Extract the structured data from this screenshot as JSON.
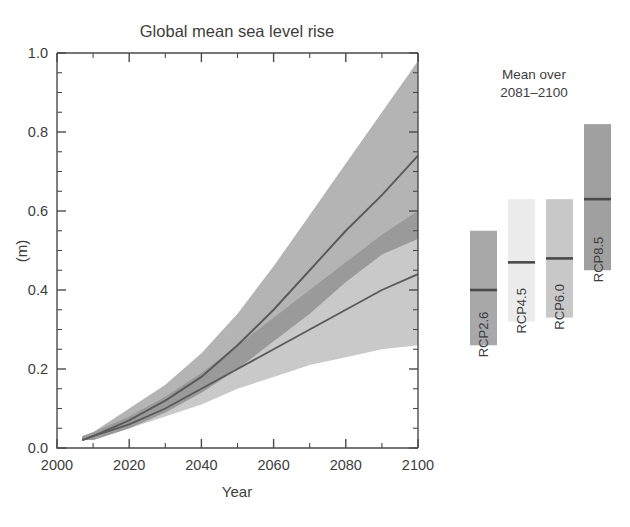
{
  "chart_data": {
    "type": "area",
    "title": "Global mean sea level rise",
    "xlabel": "Year",
    "ylabel": "(m)",
    "xlim": [
      2000,
      2100
    ],
    "ylim": [
      0.0,
      1.0
    ],
    "grid": false,
    "x_ticks": [
      2000,
      2020,
      2040,
      2060,
      2080,
      2100
    ],
    "x_tick_labels": [
      "2000",
      "2020",
      "2040",
      "2060",
      "2080",
      "2100"
    ],
    "x_minor_step": 10,
    "y_ticks": [
      0.0,
      0.2,
      0.4,
      0.6,
      0.8,
      1.0
    ],
    "y_tick_labels": [
      "0.0",
      "0.2",
      "0.4",
      "0.6",
      "0.8",
      "1.0"
    ],
    "y_minor_step": 0.05,
    "x": [
      2007,
      2010,
      2020,
      2030,
      2040,
      2050,
      2060,
      2070,
      2080,
      2090,
      2100
    ],
    "series": [
      {
        "name": "RCP8.5",
        "color": "#b4b4b4",
        "line_color": "#5a5a5a",
        "values": [
          0.02,
          0.03,
          0.07,
          0.12,
          0.18,
          0.26,
          0.35,
          0.45,
          0.55,
          0.64,
          0.74
        ],
        "lower": [
          0.02,
          0.02,
          0.05,
          0.09,
          0.14,
          0.2,
          0.27,
          0.34,
          0.42,
          0.49,
          0.53
        ],
        "upper": [
          0.03,
          0.04,
          0.1,
          0.16,
          0.24,
          0.34,
          0.46,
          0.59,
          0.72,
          0.85,
          0.98
        ]
      },
      {
        "name": "RCP2.6",
        "color": "#b4b4b4",
        "line_color": "#5a5a5a",
        "values": [
          0.02,
          0.03,
          0.06,
          0.1,
          0.15,
          0.2,
          0.25,
          0.3,
          0.35,
          0.4,
          0.44
        ],
        "lower": [
          0.02,
          0.02,
          0.05,
          0.08,
          0.11,
          0.15,
          0.18,
          0.21,
          0.23,
          0.25,
          0.26
        ],
        "upper": [
          0.03,
          0.04,
          0.08,
          0.13,
          0.19,
          0.26,
          0.33,
          0.4,
          0.47,
          0.54,
          0.6
        ]
      }
    ],
    "band_overlap_color": "#9a9a9a",
    "legend": {
      "position": "right",
      "heading_line1": "Mean over",
      "heading_line2": "2081–2100",
      "bars": [
        {
          "label": "RCP2.6",
          "color": "#a8a8a8",
          "low": 0.26,
          "high": 0.55,
          "median": 0.4
        },
        {
          "label": "RCP4.5",
          "color": "#ececec",
          "low": 0.32,
          "high": 0.63,
          "median": 0.47
        },
        {
          "label": "RCP6.0",
          "color": "#c8c8c8",
          "low": 0.33,
          "high": 0.63,
          "median": 0.48
        },
        {
          "label": "RCP8.5",
          "color": "#a0a0a0",
          "low": 0.45,
          "high": 0.82,
          "median": 0.63
        }
      ]
    }
  }
}
